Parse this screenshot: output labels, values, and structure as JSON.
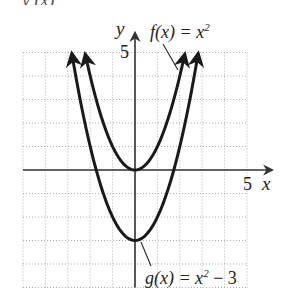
{
  "top_fragment": "y (x)",
  "chart_data": {
    "type": "line",
    "title": "",
    "xlabel": "x",
    "ylabel": "y",
    "xlim": [
      -5,
      6.1
    ],
    "ylim": [
      -5,
      5
    ],
    "grid": true,
    "grid_step": 1,
    "tick_labels": {
      "x": [
        "5"
      ],
      "y": [
        "5"
      ]
    },
    "series": [
      {
        "name": "f(x) = x^2",
        "label": "f(x) = x",
        "exponent": "2",
        "suffix": "",
        "formula": "x^2",
        "shift": 0,
        "x_range": [
          -2.22,
          2.22
        ],
        "points": [
          [
            -2,
            4
          ],
          [
            -1,
            1
          ],
          [
            0,
            0
          ],
          [
            1,
            1
          ],
          [
            2,
            4
          ]
        ]
      },
      {
        "name": "g(x) = x^2 - 3",
        "label": "g(x) = x",
        "exponent": "2",
        "suffix": " − 3",
        "formula": "x^2 - 3",
        "shift": -3,
        "x_range": [
          -2.82,
          2.82
        ],
        "points": [
          [
            -2,
            1
          ],
          [
            -1,
            -2
          ],
          [
            0,
            -3
          ],
          [
            1,
            -2
          ],
          [
            2,
            1
          ]
        ]
      }
    ],
    "annotations": [
      "f(x) = x²",
      "g(x) = x² − 3"
    ],
    "colors": {
      "curve": "#1a1a1a",
      "axis": "#333333",
      "grid": "#9a9a9a"
    }
  }
}
